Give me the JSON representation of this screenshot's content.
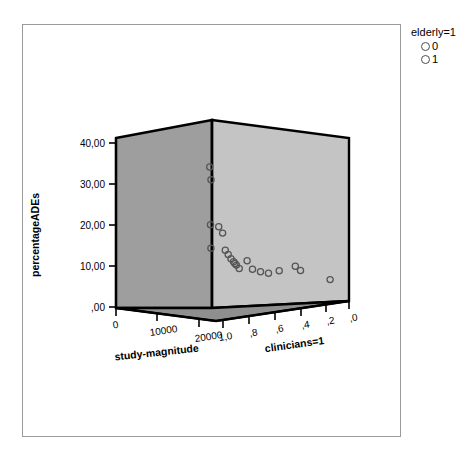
{
  "legend": {
    "title": "elderly=1",
    "items": [
      {
        "label": "0",
        "marker": "open-circle"
      },
      {
        "label": "1",
        "marker": "open-circle"
      }
    ]
  },
  "colors": {
    "left_wall": "#9e9e9e",
    "right_wall": "#c4c4c4",
    "floor": "#8f8f8f",
    "frame_line": "#000000",
    "marker_stroke": "#555555",
    "border": "#9a9a9a",
    "background": "#ffffff"
  },
  "chart_data": {
    "type": "scatter",
    "title": "",
    "subtitle": "",
    "projection": "3d",
    "xlabel": "study-magnitude",
    "ylabel": "percentageADEs",
    "zlabel": "clinicians=1",
    "xticks": [
      "0",
      "10000",
      "20000"
    ],
    "xtick_values": [
      0,
      10000,
      20000
    ],
    "yticks": [
      ",00",
      "10,00",
      "20,00",
      "30,00",
      "40,00"
    ],
    "ytick_values": [
      0,
      10,
      20,
      30,
      40
    ],
    "zticks": [
      "1,0",
      ",8",
      ",6",
      ",4",
      ",2",
      ",0"
    ],
    "ztick_values": [
      1.0,
      0.8,
      0.6,
      0.4,
      0.2,
      0.0
    ],
    "xlim": [
      0,
      25000
    ],
    "ylim": [
      0,
      44
    ],
    "zlim": [
      1.0,
      0.0
    ],
    "grid": false,
    "legend_position": "top-right",
    "legend_title": "elderly=1",
    "series": [
      {
        "name": "0",
        "marker": "open-circle",
        "points": [
          {
            "x": 1400,
            "y": 33.0,
            "z": 1.0
          },
          {
            "x": 600,
            "y": 30.0,
            "z": 1.0
          },
          {
            "x": 900,
            "y": 19.5,
            "z": 1.0
          },
          {
            "x": 700,
            "y": 14.0,
            "z": 1.0
          },
          {
            "x": 100,
            "y": 19.0,
            "z": 0.95
          },
          {
            "x": 200,
            "y": 17.5,
            "z": 0.92
          },
          {
            "x": 150,
            "y": 12.5,
            "z": 0.88
          },
          {
            "x": 120,
            "y": 11.5,
            "z": 0.86
          },
          {
            "x": 180,
            "y": 10.8,
            "z": 0.84
          },
          {
            "x": 160,
            "y": 10.0,
            "z": 0.82
          },
          {
            "x": 140,
            "y": 9.2,
            "z": 0.8
          },
          {
            "x": 300,
            "y": 11.0,
            "z": 0.74
          },
          {
            "x": 350,
            "y": 9.0,
            "z": 0.7
          },
          {
            "x": 500,
            "y": 8.4,
            "z": 0.64
          },
          {
            "x": 650,
            "y": 8.0,
            "z": 0.58
          },
          {
            "x": 800,
            "y": 8.6,
            "z": 0.5
          },
          {
            "x": 1000,
            "y": 9.6,
            "z": 0.38
          },
          {
            "x": 1200,
            "y": 8.6,
            "z": 0.34
          },
          {
            "x": 1500,
            "y": 6.4,
            "z": 0.12
          }
        ]
      },
      {
        "name": "1",
        "marker": "open-circle",
        "points": [
          {
            "x": 250,
            "y": 13.5,
            "z": 0.9
          },
          {
            "x": 220,
            "y": 10.4,
            "z": 0.83
          }
        ]
      }
    ]
  }
}
